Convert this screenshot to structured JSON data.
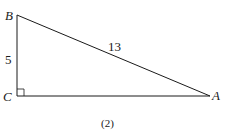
{
  "figure": {
    "caption": "(2)",
    "vertices": {
      "A": {
        "label": "A"
      },
      "B": {
        "label": "B"
      },
      "C": {
        "label": "C"
      }
    },
    "sides": {
      "BC": "5",
      "AB": "13"
    },
    "right_angle_at": "C",
    "colors": {
      "stroke": "#1a1a1a",
      "background": "#ffffff"
    }
  }
}
